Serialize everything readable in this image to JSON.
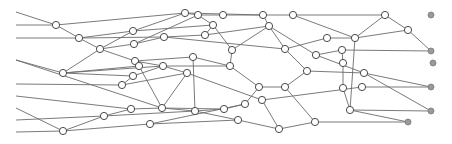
{
  "diagram": {
    "type": "network-graph",
    "width": 452,
    "height": 144,
    "colors": {
      "edge": "#6b6b6b",
      "node_fill": "#ffffff",
      "node_stroke": "#4a4a4a",
      "sink_fill": "#9a9a9a"
    },
    "inputs": [
      {
        "id": "i1",
        "x": 16,
        "y": 12
      },
      {
        "id": "i2",
        "x": 16,
        "y": 25
      },
      {
        "id": "i3",
        "x": 16,
        "y": 38
      },
      {
        "id": "i4",
        "x": 16,
        "y": 60
      },
      {
        "id": "i5",
        "x": 16,
        "y": 84
      },
      {
        "id": "i6",
        "x": 16,
        "y": 96
      },
      {
        "id": "i7",
        "x": 16,
        "y": 108
      },
      {
        "id": "i8",
        "x": 16,
        "y": 120
      },
      {
        "id": "i9",
        "x": 16,
        "y": 132
      }
    ],
    "nodes": [
      {
        "id": "n1",
        "x": 56,
        "y": 25
      },
      {
        "id": "n2",
        "x": 79,
        "y": 38
      },
      {
        "id": "n3",
        "x": 100,
        "y": 49
      },
      {
        "id": "n4",
        "x": 63,
        "y": 73
      },
      {
        "id": "n5",
        "x": 63,
        "y": 131
      },
      {
        "id": "n6",
        "x": 104,
        "y": 116
      },
      {
        "id": "n7",
        "x": 131,
        "y": 109
      },
      {
        "id": "n8",
        "x": 122,
        "y": 85
      },
      {
        "id": "n9",
        "x": 133,
        "y": 31
      },
      {
        "id": "n10",
        "x": 134,
        "y": 44
      },
      {
        "id": "n11",
        "x": 135,
        "y": 61
      },
      {
        "id": "n12",
        "x": 139,
        "y": 66
      },
      {
        "id": "n13",
        "x": 133,
        "y": 76
      },
      {
        "id": "n14",
        "x": 185,
        "y": 13
      },
      {
        "id": "n15",
        "x": 198,
        "y": 15
      },
      {
        "id": "n16",
        "x": 213,
        "y": 25
      },
      {
        "id": "n17",
        "x": 223,
        "y": 15
      },
      {
        "id": "n18",
        "x": 205,
        "y": 35
      },
      {
        "id": "n19",
        "x": 164,
        "y": 37
      },
      {
        "id": "n20",
        "x": 163,
        "y": 66
      },
      {
        "id": "n21",
        "x": 187,
        "y": 73
      },
      {
        "id": "n22",
        "x": 193,
        "y": 57
      },
      {
        "id": "n23",
        "x": 162,
        "y": 108
      },
      {
        "id": "n24",
        "x": 195,
        "y": 111
      },
      {
        "id": "n25",
        "x": 150,
        "y": 124
      },
      {
        "id": "n26",
        "x": 230,
        "y": 66
      },
      {
        "id": "n27",
        "x": 224,
        "y": 109
      },
      {
        "id": "n28",
        "x": 238,
        "y": 120
      },
      {
        "id": "n29",
        "x": 245,
        "y": 104
      },
      {
        "id": "n30",
        "x": 263,
        "y": 15
      },
      {
        "id": "n31",
        "x": 269,
        "y": 26
      },
      {
        "id": "n32",
        "x": 285,
        "y": 49
      },
      {
        "id": "n33",
        "x": 293,
        "y": 15
      },
      {
        "id": "n34",
        "x": 307,
        "y": 71
      },
      {
        "id": "n35",
        "x": 259,
        "y": 87
      },
      {
        "id": "n36",
        "x": 262,
        "y": 100
      },
      {
        "id": "n37",
        "x": 279,
        "y": 129
      },
      {
        "id": "n38",
        "x": 232,
        "y": 50
      },
      {
        "id": "n39",
        "x": 327,
        "y": 38
      },
      {
        "id": "n40",
        "x": 316,
        "y": 55
      },
      {
        "id": "n41",
        "x": 342,
        "y": 50
      },
      {
        "id": "n42",
        "x": 343,
        "y": 63
      },
      {
        "id": "n43",
        "x": 355,
        "y": 38
      },
      {
        "id": "n44",
        "x": 385,
        "y": 15
      },
      {
        "id": "n45",
        "x": 408,
        "y": 30
      },
      {
        "id": "n46",
        "x": 364,
        "y": 73
      },
      {
        "id": "n47",
        "x": 350,
        "y": 110
      },
      {
        "id": "n48",
        "x": 315,
        "y": 122
      },
      {
        "id": "n49",
        "x": 362,
        "y": 87
      },
      {
        "id": "n50",
        "x": 343,
        "y": 88
      },
      {
        "id": "n51",
        "x": 285,
        "y": 87
      }
    ],
    "sinks": [
      {
        "id": "s1",
        "x": 431,
        "y": 15
      },
      {
        "id": "s2",
        "x": 431,
        "y": 51
      },
      {
        "id": "s3",
        "x": 433,
        "y": 63
      },
      {
        "id": "s4",
        "x": 431,
        "y": 87
      },
      {
        "id": "s5",
        "x": 431,
        "y": 111
      },
      {
        "id": "s6",
        "x": 408,
        "y": 122
      }
    ],
    "edges": [
      [
        "i1",
        "n1"
      ],
      [
        "i2",
        "n1"
      ],
      [
        "i3",
        "n2"
      ],
      [
        "n1",
        "n2"
      ],
      [
        "n2",
        "n3"
      ],
      [
        "n1",
        "n14"
      ],
      [
        "n2",
        "n9"
      ],
      [
        "n2",
        "n19"
      ],
      [
        "n3",
        "n10"
      ],
      [
        "n3",
        "n11"
      ],
      [
        "n3",
        "n9"
      ],
      [
        "n3",
        "n4"
      ],
      [
        "i4",
        "n4"
      ],
      [
        "i5",
        "n8"
      ],
      [
        "i6",
        "n7"
      ],
      [
        "i7",
        "n5"
      ],
      [
        "i8",
        "n6"
      ],
      [
        "i9",
        "n5"
      ],
      [
        "i4",
        "n23"
      ],
      [
        "n4",
        "n13"
      ],
      [
        "n4",
        "n12"
      ],
      [
        "n4",
        "n20"
      ],
      [
        "n5",
        "n6"
      ],
      [
        "n5",
        "n25"
      ],
      [
        "n6",
        "n7"
      ],
      [
        "n6",
        "n24"
      ],
      [
        "n7",
        "n23"
      ],
      [
        "n8",
        "n13"
      ],
      [
        "n8",
        "n21"
      ],
      [
        "n9",
        "n14"
      ],
      [
        "n9",
        "n16"
      ],
      [
        "n10",
        "n19"
      ],
      [
        "n10",
        "n15"
      ],
      [
        "n11",
        "n22"
      ],
      [
        "n11",
        "n20"
      ],
      [
        "n12",
        "n23"
      ],
      [
        "n13",
        "n20"
      ],
      [
        "n14",
        "n15"
      ],
      [
        "n14",
        "n30"
      ],
      [
        "n15",
        "n17"
      ],
      [
        "n15",
        "n16"
      ],
      [
        "n16",
        "n18"
      ],
      [
        "n16",
        "n38"
      ],
      [
        "n17",
        "n30"
      ],
      [
        "n18",
        "n19"
      ],
      [
        "n18",
        "n31"
      ],
      [
        "n19",
        "n32"
      ],
      [
        "n20",
        "n26"
      ],
      [
        "n20",
        "n21"
      ],
      [
        "n21",
        "n23"
      ],
      [
        "n21",
        "n36"
      ],
      [
        "n22",
        "n26"
      ],
      [
        "n22",
        "n24"
      ],
      [
        "n23",
        "n24"
      ],
      [
        "n23",
        "n27"
      ],
      [
        "n24",
        "n27"
      ],
      [
        "n24",
        "n28"
      ],
      [
        "n25",
        "n29"
      ],
      [
        "n25",
        "n28"
      ],
      [
        "n26",
        "n38"
      ],
      [
        "n26",
        "n35"
      ],
      [
        "n27",
        "n29"
      ],
      [
        "n28",
        "n37"
      ],
      [
        "n29",
        "n35"
      ],
      [
        "n30",
        "n33"
      ],
      [
        "n30",
        "n31"
      ],
      [
        "n31",
        "n32"
      ],
      [
        "n31",
        "n40"
      ],
      [
        "n33",
        "n44"
      ],
      [
        "n33",
        "n43"
      ],
      [
        "n32",
        "n39"
      ],
      [
        "n32",
        "n34"
      ],
      [
        "n34",
        "n46"
      ],
      [
        "n34",
        "n51"
      ],
      [
        "n35",
        "n51"
      ],
      [
        "n36",
        "n37"
      ],
      [
        "n36",
        "n49"
      ],
      [
        "n37",
        "n48"
      ],
      [
        "n38",
        "n31"
      ],
      [
        "n39",
        "n43"
      ],
      [
        "n40",
        "n41"
      ],
      [
        "n40",
        "n46"
      ],
      [
        "n41",
        "n42"
      ],
      [
        "n41",
        "s2"
      ],
      [
        "n42",
        "n50"
      ],
      [
        "n43",
        "n44"
      ],
      [
        "n43",
        "n45"
      ],
      [
        "n43",
        "n47"
      ],
      [
        "n44",
        "n45"
      ],
      [
        "n45",
        "s2"
      ],
      [
        "n46",
        "s4"
      ],
      [
        "n46",
        "s5"
      ],
      [
        "n47",
        "s5"
      ],
      [
        "n47",
        "s6"
      ],
      [
        "n48",
        "s6"
      ],
      [
        "n49",
        "s4"
      ],
      [
        "n50",
        "n47"
      ],
      [
        "n51",
        "n48"
      ]
    ]
  }
}
